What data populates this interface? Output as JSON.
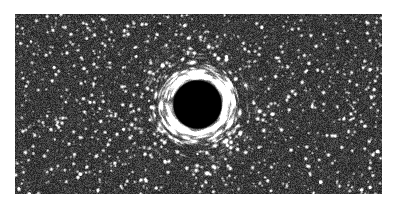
{
  "page": {
    "title": "Black Hole Gravitational Lensing Simulation",
    "width": 397,
    "height": 208,
    "background_color": "#ffffff",
    "media_type": "grayscale-astronomical-render"
  },
  "image_frame": {
    "x": 15,
    "y": 14,
    "width": 367,
    "height": 180,
    "border": "none",
    "description": "Dense monochrome starfield with a central black hole shadow and lensed arcs"
  },
  "chart_data": {
    "type": "heatmap",
    "title": "Black Hole Gravitational Lensing Simulation",
    "xlabel": "",
    "ylabel": "",
    "colormap": "grayscale",
    "value_range": [
      0,
      255
    ],
    "grid": false,
    "legend": "none",
    "field": {
      "name": "dense-starfield",
      "star_count": 2600,
      "background_mean_level": 58,
      "background_noise_amplitude": 30,
      "star_peak_level": 255,
      "pixel_scale": 1
    },
    "black_hole": {
      "label": "event-horizon-shadow",
      "center_x": 197,
      "center_y": 104,
      "shadow_radius": 25,
      "shadow_color": "#000000",
      "photon_ring_radius": 28,
      "photon_ring_width": 4,
      "photon_ring_peak_level": 235,
      "einstein_ring_radius": 34,
      "lensing_outer_radius": 72,
      "arc_count": 26,
      "description": "Central dark shadow surrounded by bright photon ring and tangentially stretched star arcs"
    }
  },
  "annotations": {
    "caption": "",
    "axis_labels": [],
    "legend_entries": [],
    "scale_bar": ""
  }
}
